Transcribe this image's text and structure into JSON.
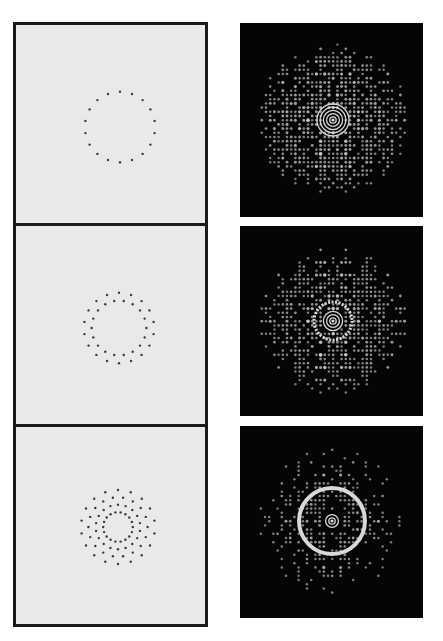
{
  "figure": {
    "colors": {
      "aperture_background": "#e9e9e9",
      "aperture_dot": "#3a3a3a",
      "frame": "#1a1a1a",
      "pattern_background": "#050505",
      "pattern_light": "#d8d8d8"
    },
    "rows": [
      {
        "name": "single-ring",
        "aperture": {
          "rings": [
            {
              "count": 18,
              "radius_rel": 0.95,
              "phase_deg": 0
            }
          ]
        },
        "pattern": {
          "symmetry": 18,
          "central_rings": 5,
          "halo_ring": false
        }
      },
      {
        "name": "double-ring",
        "aperture": {
          "rings": [
            {
              "count": 18,
              "radius_rel": 0.95,
              "phase_deg": 0
            },
            {
              "count": 18,
              "radius_rel": 0.74,
              "phase_deg": 10
            }
          ]
        },
        "pattern": {
          "symmetry": 18,
          "central_rings": 3,
          "halo_ring": true
        }
      },
      {
        "name": "quadruple-ring",
        "aperture": {
          "rings": [
            {
              "count": 18,
              "radius_rel": 1.0,
              "phase_deg": 0
            },
            {
              "count": 18,
              "radius_rel": 0.8,
              "phase_deg": 10
            },
            {
              "count": 18,
              "radius_rel": 0.6,
              "phase_deg": 0
            },
            {
              "count": 18,
              "radius_rel": 0.4,
              "phase_deg": 10
            }
          ]
        },
        "pattern": {
          "symmetry": 18,
          "central_rings": 2,
          "halo_ring": true
        }
      }
    ]
  }
}
